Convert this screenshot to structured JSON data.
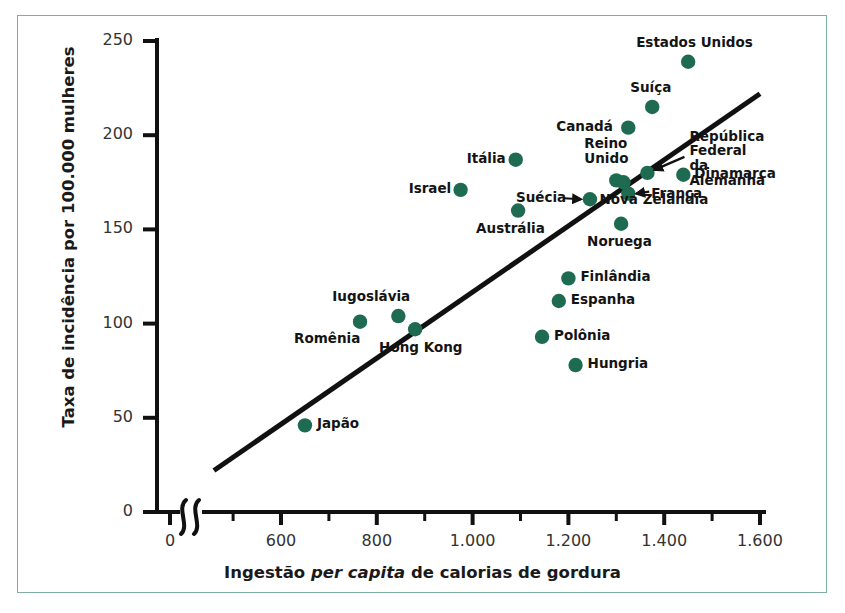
{
  "figure": {
    "frame_color": "#7fae9d",
    "point_color": "#1f6b52",
    "line_color": "#111111",
    "background": "#ffffff"
  },
  "axes": {
    "y_title": "Taxa de incidência por 100.000 mulheres",
    "x_title_parts": {
      "before": "Ingestão ",
      "italic": "per capita",
      "after": " de calorias de gordura"
    },
    "x_title_full": "Ingestão per capita de calorias de gordura",
    "y_ticks": [
      "0",
      "50",
      "100",
      "150",
      "200",
      "250"
    ],
    "y_tick_values": [
      0,
      50,
      100,
      150,
      200,
      250
    ],
    "x_ticks": [
      "0",
      "600",
      "800",
      "1.000",
      "1.200",
      "1.400",
      "1.600"
    ],
    "x_tick_values": [
      0,
      600,
      800,
      1000,
      1200,
      1400,
      1600
    ],
    "x_minor_ticks": [
      500,
      700,
      900,
      1100,
      1300,
      1500
    ],
    "axis_break": true,
    "y_range": [
      0,
      250
    ],
    "x_range_plotted": [
      460,
      1620
    ]
  },
  "chart_data": {
    "type": "scatter",
    "title": "",
    "xlabel": "Ingestão per capita de calorias de gordura",
    "ylabel": "Taxa de incidência por 100.000 mulheres",
    "xlim": [
      0,
      1600
    ],
    "ylim": [
      0,
      250
    ],
    "grid": false,
    "legend": false,
    "point_color": "#1f6b52",
    "points": [
      {
        "name": "Estados Unidos",
        "x": 1450,
        "y": 239,
        "label_pos": "top"
      },
      {
        "name": "Suíça",
        "x": 1375,
        "y": 215,
        "label_pos": "top"
      },
      {
        "name": "Canadá",
        "x": 1325,
        "y": 204,
        "label_pos": "left"
      },
      {
        "name": "República Federal da Alemanha",
        "x": 1365,
        "y": 180,
        "label_pos": "arrow-right"
      },
      {
        "name": "Dinamarca",
        "x": 1440,
        "y": 179,
        "label_pos": "right"
      },
      {
        "name": "Reino Unido",
        "x": 1300,
        "y": 176,
        "label_pos": "top"
      },
      {
        "name": "França",
        "x": 1325,
        "y": 169,
        "label_pos": "arrow-right"
      },
      {
        "name": "Nova Zelândia",
        "x": 1315,
        "y": 175,
        "label_pos": "bottom"
      },
      {
        "name": "Itália",
        "x": 1090,
        "y": 187,
        "label_pos": "left"
      },
      {
        "name": "Israel",
        "x": 975,
        "y": 171,
        "label_pos": "left"
      },
      {
        "name": "Suécia",
        "x": 1245,
        "y": 166,
        "label_pos": "arrow-left"
      },
      {
        "name": "Austrália",
        "x": 1095,
        "y": 160,
        "label_pos": "bottom"
      },
      {
        "name": "Noruega",
        "x": 1310,
        "y": 153,
        "label_pos": "bottom"
      },
      {
        "name": "Finlândia",
        "x": 1200,
        "y": 124,
        "label_pos": "right"
      },
      {
        "name": "Espanha",
        "x": 1180,
        "y": 112,
        "label_pos": "right"
      },
      {
        "name": "Iugoslávia",
        "x": 845,
        "y": 104,
        "label_pos": "top"
      },
      {
        "name": "Romênia",
        "x": 765,
        "y": 101,
        "label_pos": "bottom-left"
      },
      {
        "name": "Hong Kong",
        "x": 880,
        "y": 97,
        "label_pos": "bottom"
      },
      {
        "name": "Polônia",
        "x": 1145,
        "y": 93,
        "label_pos": "right"
      },
      {
        "name": "Hungria",
        "x": 1215,
        "y": 78,
        "label_pos": "right"
      },
      {
        "name": "Japão",
        "x": 650,
        "y": 46,
        "label_pos": "right"
      }
    ],
    "trend_line": {
      "x1": 460,
      "y1": 22,
      "x2": 1600,
      "y2": 222
    }
  }
}
